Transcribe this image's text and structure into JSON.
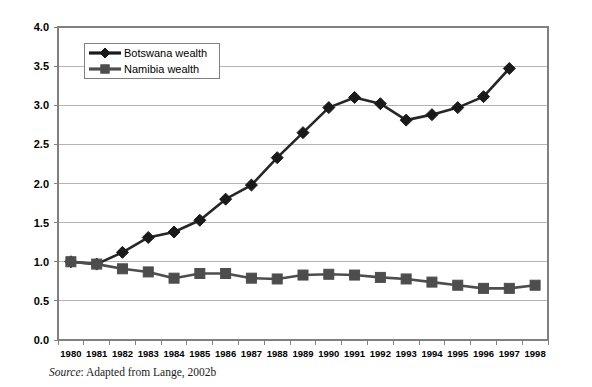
{
  "figure": {
    "source_note_prefix": "Source",
    "source_note_text": ": Adapted from Lange, 2002b"
  },
  "legend": {
    "position": "top-left-inside",
    "entries": [
      {
        "label": "Botswana wealth",
        "marker": "diamond-marker",
        "color": "#1a1a1a"
      },
      {
        "label": "Namibia wealth",
        "marker": "square-marker",
        "color": "#4d4d4d"
      }
    ]
  },
  "axes": {
    "y_ticks": [
      "0.0",
      "0.5",
      "1.0",
      "1.5",
      "2.0",
      "2.5",
      "3.0",
      "3.5",
      "4.0"
    ],
    "x_ticks": [
      "1980",
      "1981",
      "1982",
      "1983",
      "1984",
      "1985",
      "1986",
      "1987",
      "1988",
      "1989",
      "1990",
      "1991",
      "1992",
      "1993",
      "1994",
      "1995",
      "1996",
      "1997",
      "1998"
    ]
  },
  "colors": {
    "botswana": "#1a1a1a",
    "namibia": "#4d4d4d",
    "gridline": "#b4b4b4",
    "frame": "#808080",
    "background": "#ffffff"
  },
  "chart_data": {
    "type": "line",
    "title": "",
    "xlabel": "",
    "ylabel": "",
    "ylim": [
      0.0,
      4.0
    ],
    "ytick_step": 0.5,
    "grid": true,
    "legend_position": "top-left-inside",
    "categories": [
      "1980",
      "1981",
      "1982",
      "1983",
      "1984",
      "1985",
      "1986",
      "1987",
      "1988",
      "1989",
      "1990",
      "1991",
      "1992",
      "1993",
      "1994",
      "1995",
      "1996",
      "1997",
      "1998"
    ],
    "series": [
      {
        "name": "Botswana wealth",
        "marker": "diamond",
        "color": "#1a1a1a",
        "values": [
          1.0,
          0.97,
          1.12,
          1.31,
          1.38,
          1.53,
          1.8,
          1.98,
          2.33,
          2.65,
          2.97,
          3.1,
          3.02,
          2.81,
          2.88,
          2.97,
          3.11,
          3.47,
          null
        ]
      },
      {
        "name": "Namibia wealth",
        "marker": "square",
        "color": "#4d4d4d",
        "values": [
          1.0,
          0.97,
          0.91,
          0.87,
          0.79,
          0.85,
          0.85,
          0.79,
          0.78,
          0.83,
          0.84,
          0.83,
          0.8,
          0.78,
          0.74,
          0.7,
          0.66,
          0.66,
          0.7
        ]
      }
    ]
  }
}
